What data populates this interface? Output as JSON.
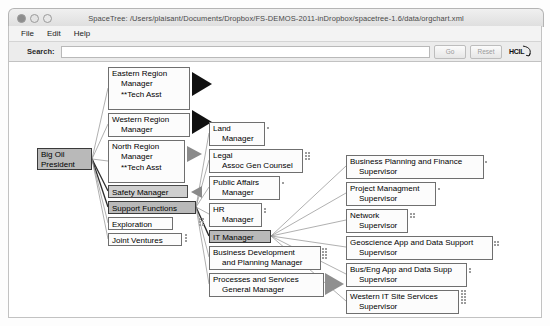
{
  "window": {
    "title": "SpaceTree: /Users/plaisant/Documents/Dropbox/FS-DEMOS-2011-inDropbox/spacetree-1.6/data/orgchart.xml",
    "controls": {
      "close": "close-button",
      "minimize": "minimize-button",
      "zoom": "zoom-button"
    }
  },
  "menubar": {
    "items": [
      {
        "label": "File"
      },
      {
        "label": "Edit"
      },
      {
        "label": "Help"
      }
    ]
  },
  "toolbar": {
    "search_label": "Search:",
    "search_value": "",
    "search_placeholder": "",
    "go_label": "Go",
    "reset_label": "Reset",
    "logo_label": "HCIL"
  },
  "tree": {
    "nodes": [
      {
        "id": "big-oil-president",
        "lines": [
          "Big Oil",
          "President"
        ],
        "x": 28,
        "y": 86,
        "w": 55,
        "h": 22,
        "state": "selected",
        "indent": false
      },
      {
        "id": "eastern-region",
        "lines": [
          "Eastern Region",
          "Manager",
          "",
          "**Tech Asst"
        ],
        "x": 99,
        "y": 5,
        "w": 82,
        "h": 42,
        "state": "normal",
        "indent": true
      },
      {
        "id": "western-region",
        "lines": [
          "Western Region",
          "Manager"
        ],
        "x": 99,
        "y": 51,
        "w": 82,
        "h": 23,
        "state": "normal",
        "indent": true
      },
      {
        "id": "north-region",
        "lines": [
          "North Region",
          "Manager",
          "",
          "**Tech Asst"
        ],
        "x": 99,
        "y": 78,
        "w": 76,
        "h": 42,
        "state": "normal",
        "indent": true
      },
      {
        "id": "safety-manager",
        "lines": [
          "Safety Manager"
        ],
        "x": 99,
        "y": 123,
        "w": 80,
        "h": 13,
        "state": "shaded",
        "indent": false
      },
      {
        "id": "support-functions",
        "lines": [
          "Support Functions"
        ],
        "x": 99,
        "y": 139,
        "w": 88,
        "h": 13,
        "state": "selected",
        "indent": false
      },
      {
        "id": "exploration",
        "lines": [
          "Exploration"
        ],
        "x": 99,
        "y": 155,
        "w": 65,
        "h": 13,
        "state": "normal",
        "indent": false
      },
      {
        "id": "joint-ventures",
        "lines": [
          "Joint Ventures"
        ],
        "x": 99,
        "y": 171,
        "w": 73,
        "h": 13,
        "state": "normal",
        "indent": false
      },
      {
        "id": "land-manager",
        "lines": [
          "Land",
          "Manager"
        ],
        "x": 200,
        "y": 60,
        "w": 56,
        "h": 23,
        "state": "normal",
        "indent": true
      },
      {
        "id": "legal-counsel",
        "lines": [
          "Legal",
          "Assoc Gen Counsel"
        ],
        "x": 200,
        "y": 87,
        "w": 93,
        "h": 23,
        "state": "normal",
        "indent": true
      },
      {
        "id": "public-affairs",
        "lines": [
          "Public Affairs",
          "Manager"
        ],
        "x": 200,
        "y": 114,
        "w": 70,
        "h": 23,
        "state": "normal",
        "indent": true
      },
      {
        "id": "hr-manager",
        "lines": [
          "HR",
          "Manager"
        ],
        "x": 200,
        "y": 141,
        "w": 52,
        "h": 23,
        "state": "normal",
        "indent": true
      },
      {
        "id": "it-manager",
        "lines": [
          "IT Manager"
        ],
        "x": 200,
        "y": 168,
        "w": 62,
        "h": 13,
        "state": "selected",
        "indent": false
      },
      {
        "id": "business-dev",
        "lines": [
          "Business Development",
          "and Planning Manager"
        ],
        "x": 200,
        "y": 184,
        "w": 110,
        "h": 23,
        "state": "normal",
        "indent": true
      },
      {
        "id": "processes-services",
        "lines": [
          "Processes and Services",
          "General Manager"
        ],
        "x": 200,
        "y": 211,
        "w": 114,
        "h": 23,
        "state": "normal",
        "indent": true
      },
      {
        "id": "business-planning",
        "lines": [
          "Business Planning and Finance",
          "Supervisor"
        ],
        "x": 337,
        "y": 93,
        "w": 136,
        "h": 23,
        "state": "normal",
        "indent": true
      },
      {
        "id": "project-management",
        "lines": [
          "Project Managment",
          "Supervisor"
        ],
        "x": 337,
        "y": 120,
        "w": 89,
        "h": 23,
        "state": "normal",
        "indent": true
      },
      {
        "id": "network-supervisor",
        "lines": [
          "Network",
          "Supervisor"
        ],
        "x": 337,
        "y": 147,
        "w": 61,
        "h": 23,
        "state": "normal",
        "indent": true
      },
      {
        "id": "geoscience-support",
        "lines": [
          "Geoscience App and Data Support",
          "Supervisor"
        ],
        "x": 337,
        "y": 174,
        "w": 145,
        "h": 23,
        "state": "normal",
        "indent": true
      },
      {
        "id": "bus-eng-support",
        "lines": [
          "Bus/Eng App and Data Supp",
          "Supervisor"
        ],
        "x": 337,
        "y": 201,
        "w": 120,
        "h": 23,
        "state": "normal",
        "indent": true
      },
      {
        "id": "western-it-site",
        "lines": [
          "Western IT Site Services",
          "Supervisor"
        ],
        "x": 337,
        "y": 228,
        "w": 112,
        "h": 23,
        "state": "normal",
        "indent": true
      }
    ],
    "collapsed_markers": [
      {
        "id": "eastern-region-collapsed",
        "x": 183,
        "y": 10,
        "style": "dark"
      },
      {
        "id": "western-region-collapsed",
        "x": 183,
        "y": 50,
        "style": "dark"
      },
      {
        "id": "north-region-collapsed",
        "x": 178,
        "y": 85,
        "style": "gray"
      },
      {
        "id": "safety-collapsed",
        "x": 182,
        "y": 124,
        "style": "gray-l"
      },
      {
        "id": "processes-collapsed",
        "x": 316,
        "y": 211,
        "style": "gray-big"
      }
    ]
  }
}
